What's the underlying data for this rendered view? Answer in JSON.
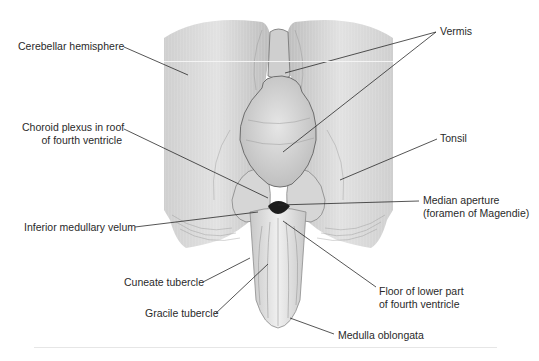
{
  "figure": {
    "colors": {
      "tissue": "#d4d4d4",
      "tissue_light": "#e8e8e8",
      "fold": "#8a8a8a",
      "aperture": "#1e1e1e",
      "leader": "#2a2a2a",
      "text": "#2a2a2a"
    }
  },
  "labels": {
    "cerebellar_hemisphere": "Cerebellar hemisphere",
    "vermis": "Vermis",
    "choroid_plexus_line1": "Choroid plexus in roof",
    "choroid_plexus_line2": "of fourth ventricle",
    "tonsil": "Tonsil",
    "median_aperture_line1": "Median aperture",
    "median_aperture_line2": "(foramen of Magendie)",
    "inferior_medullary_velum": "Inferior medullary velum",
    "cuneate_tubercle": "Cuneate tubercle",
    "gracile_tubercle": "Gracile tubercle",
    "floor_line1": "Floor of lower part",
    "floor_line2": "of fourth ventricle",
    "medulla_oblongata": "Medulla oblongata"
  }
}
